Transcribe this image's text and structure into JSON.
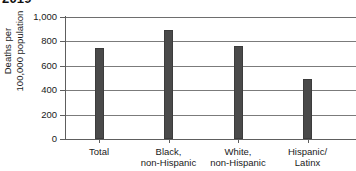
{
  "chart_data": {
    "type": "bar",
    "title": "2019",
    "subtitle": "",
    "xlabel": "",
    "ylabel": "Deaths per\n100,000 population",
    "categories": [
      "Total",
      "Black,\nnon-Hispanic",
      "White,\nnon-Hispanic",
      "Hispanic/\nLatinx"
    ],
    "values": [
      742,
      893,
      762,
      492
    ],
    "series": [
      {
        "name": "Deaths per 100,000 population",
        "values": [
          742,
          893,
          762,
          492
        ]
      }
    ],
    "ylim": [
      0,
      1000
    ],
    "yticks": [
      0,
      200,
      400,
      600,
      800,
      1000
    ],
    "ytick_labels": [
      "0",
      "200",
      "400",
      "600",
      "800",
      "1,000"
    ],
    "grid": true,
    "grid_axis": "y",
    "legend": false,
    "legend_position": "none",
    "bar_color": "#4a4a4a",
    "axis_color": "#5e5e5e",
    "gridline_color": "#7b7b7b",
    "background_color": "#ffffff"
  }
}
